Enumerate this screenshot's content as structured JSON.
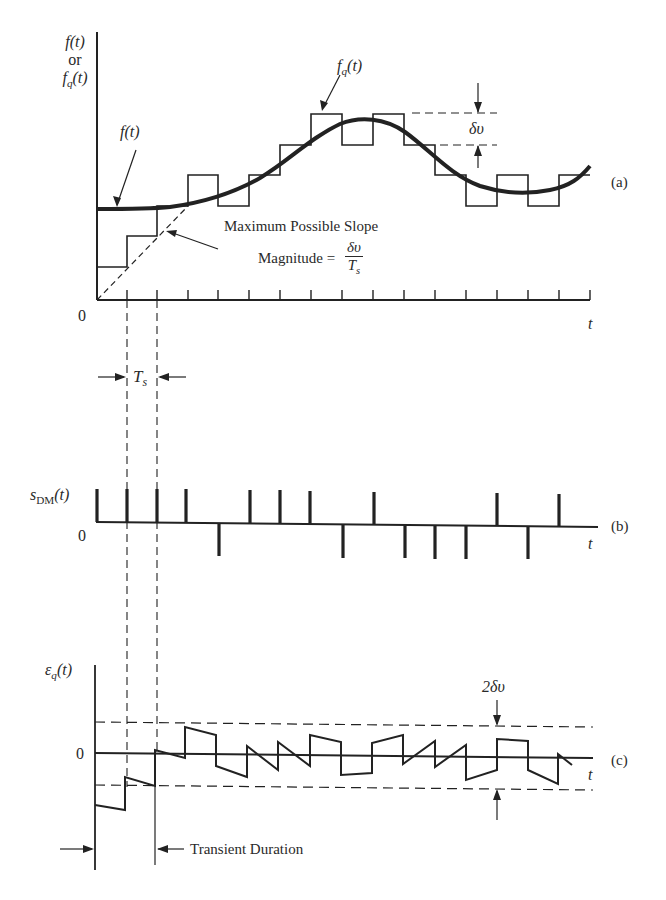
{
  "figure": {
    "panels": {
      "a": {
        "tag": "(a)",
        "y_axis_label": {
          "line1": "f(t)",
          "line2": "or",
          "line3_main": "f",
          "line3_sub": "q",
          "line3_rest": "(t)"
        },
        "origin_label": "0",
        "x_axis_label": "t",
        "curve_label": "f(t)",
        "staircase_label_main": "f",
        "staircase_label_sub": "q",
        "staircase_label_rest": "(t)",
        "step_size_label": "δυ",
        "slope_annotation": {
          "line1": "Maximum Possible Slope",
          "line2_prefix": "Magnitude =",
          "numerator": "δυ",
          "denominator_main": "T",
          "denominator_sub": "s"
        },
        "sampling_period_label_main": "T",
        "sampling_period_label_sub": "s"
      },
      "b": {
        "tag": "(b)",
        "y_axis_label_main": "s",
        "y_axis_label_sub": "DM",
        "y_axis_label_rest": "(t)",
        "origin_label": "0",
        "x_axis_label": "t",
        "pulse_signs": [
          1,
          1,
          1,
          1,
          -1,
          1,
          1,
          1,
          -1,
          1,
          -1,
          -1,
          -1,
          1,
          -1,
          1
        ]
      },
      "c": {
        "tag": "(c)",
        "y_axis_label_main": "ε",
        "y_axis_label_sub": "q",
        "y_axis_label_rest": "(t)",
        "origin_label": "0",
        "x_axis_label": "t",
        "band_label": "2δυ",
        "transient_label": "Transient Duration"
      }
    },
    "colors": {
      "ink": "#222222",
      "background": "#ffffff"
    }
  }
}
